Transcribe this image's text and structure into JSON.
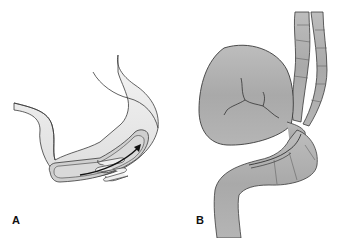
{
  "figure": {
    "panels": [
      {
        "label": "A",
        "description": "Intussusception of bowel segment with arrow showing telescoping direction"
      },
      {
        "label": "B",
        "description": "Volvulus: distended twisted colon loop with mesentery vessels"
      }
    ]
  },
  "colors": {
    "outline": "#3a3a3a",
    "bowel_light": "#e6e6e6",
    "bowel_inner": "#cfcfcf",
    "bowel_dark": "#a8a8a8",
    "background": "#ffffff"
  }
}
